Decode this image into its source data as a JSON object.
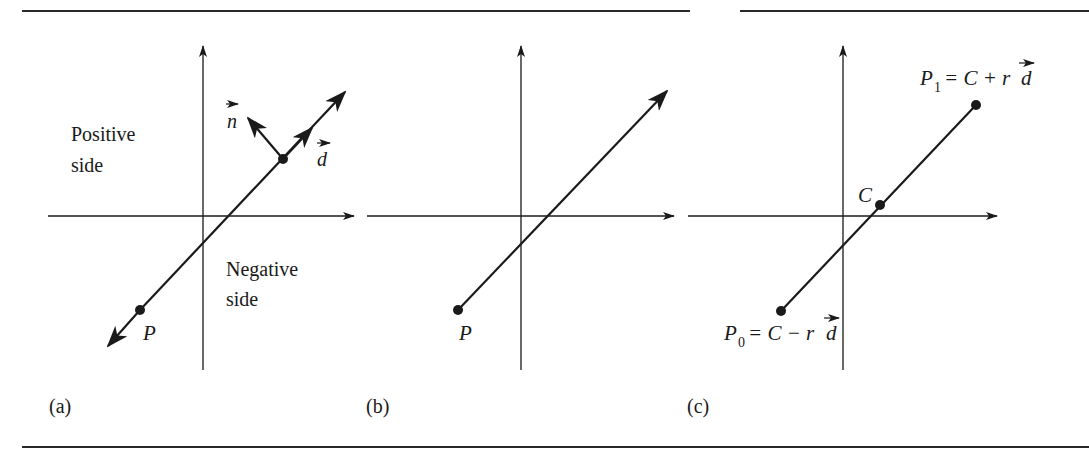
{
  "figure": {
    "rule_color": "#2a2a2a",
    "ink_color": "#1a1a1a",
    "panels": [
      {
        "id": "a",
        "caption": "(a)",
        "labels": {
          "positive_line1": "Positive",
          "positive_line2": "side",
          "negative_line1": "Negative",
          "negative_line2": "side",
          "point": "P",
          "normal": "n",
          "direction": "d"
        },
        "description": "Infinite line through point P with direction vector d and normal vector n; positive side above-left, negative side below-right"
      },
      {
        "id": "b",
        "caption": "(b)",
        "labels": {
          "point": "P"
        },
        "description": "Ray starting at point P"
      },
      {
        "id": "c",
        "caption": "(c)",
        "labels": {
          "center": "C",
          "p1_name": "P",
          "p1_sub": "1",
          "p1_expr": "= C + r",
          "p1_vec": "d",
          "p0_name": "P",
          "p0_sub": "0",
          "p0_expr": "= C − r",
          "p0_vec": "d"
        },
        "description": "Line segment from P0 to P1 with center C"
      }
    ]
  }
}
